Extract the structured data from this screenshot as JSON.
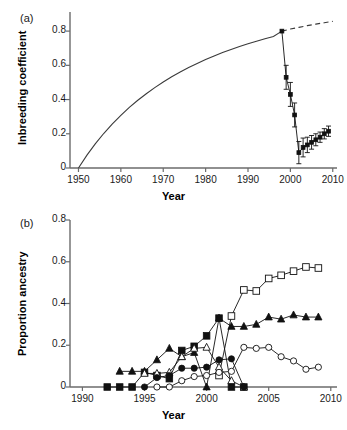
{
  "figure": {
    "panel_a_label": "(a)",
    "panel_b_label": "(b)"
  },
  "chart_data": [
    {
      "id": "panel_a",
      "type": "line",
      "title": "",
      "panel_label": "(a)",
      "xlabel": "Year",
      "ylabel": "Inbreeding coefficient",
      "xlim": [
        1948,
        2011
      ],
      "ylim": [
        0,
        0.9
      ],
      "xticks": [
        1950,
        1960,
        1970,
        1980,
        1990,
        2000,
        2010
      ],
      "xtick_labels": [
        "1950",
        "1960",
        "1970",
        "1980",
        "1990",
        "2000",
        "2010"
      ],
      "yticks": [
        0,
        0.2,
        0.4,
        0.6,
        0.8
      ],
      "ytick_labels": [
        "0",
        "0.2",
        "0.4",
        "0.6",
        "0.8"
      ],
      "grid": false,
      "legend": "none",
      "series": [
        {
          "name": "Predicted inbreeding accumulation (solid curve)",
          "style": "solid-curve",
          "x": [
            1950,
            1952,
            1954,
            1956,
            1958,
            1960,
            1962,
            1964,
            1966,
            1968,
            1970,
            1972,
            1974,
            1976,
            1978,
            1980,
            1982,
            1984,
            1986,
            1988,
            1990,
            1992,
            1994,
            1996,
            1998
          ],
          "values": [
            0.0,
            0.075,
            0.142,
            0.203,
            0.258,
            0.308,
            0.354,
            0.396,
            0.434,
            0.47,
            0.503,
            0.533,
            0.561,
            0.587,
            0.611,
            0.634,
            0.655,
            0.675,
            0.693,
            0.71,
            0.726,
            0.741,
            0.755,
            0.768,
            0.8
          ]
        },
        {
          "name": "Predicted inbreeding extrapolation (dashed curve)",
          "style": "dashed-curve",
          "x": [
            1998,
            2000,
            2002,
            2004,
            2006,
            2008,
            2010
          ],
          "values": [
            0.8,
            0.812,
            0.822,
            0.832,
            0.841,
            0.849,
            0.857
          ]
        },
        {
          "name": "Observed inbreeding coefficient (points with 95% CI)",
          "style": "points-errorbars",
          "x": [
            1998,
            1999,
            2000,
            2001,
            2002,
            2003,
            2004,
            2005,
            2006,
            2007,
            2008,
            2009
          ],
          "values": [
            0.8,
            0.53,
            0.43,
            0.31,
            0.09,
            0.12,
            0.135,
            0.15,
            0.165,
            0.18,
            0.2,
            0.215
          ],
          "err_low": [
            0.0,
            0.07,
            0.07,
            0.07,
            0.065,
            0.055,
            0.045,
            0.04,
            0.035,
            0.03,
            0.03,
            0.03
          ],
          "err_high": [
            0.0,
            0.07,
            0.07,
            0.07,
            0.065,
            0.055,
            0.045,
            0.04,
            0.035,
            0.03,
            0.03,
            0.03
          ]
        }
      ]
    },
    {
      "id": "panel_b",
      "type": "line",
      "title": "",
      "panel_label": "(b)",
      "xlabel": "Year",
      "ylabel": "Proportion ancestry",
      "xlim": [
        1989,
        2010.5
      ],
      "ylim": [
        0,
        0.8
      ],
      "xticks": [
        1990,
        1995,
        2000,
        2005,
        2010
      ],
      "xtick_labels": [
        "1990",
        "1995",
        "2000",
        "2005",
        "2010"
      ],
      "yticks": [
        0,
        0.2,
        0.4,
        0.6,
        0.8
      ],
      "ytick_labels": [
        "0",
        "0.2",
        "0.4",
        "0.6",
        "0.8"
      ],
      "grid": false,
      "legend": "none",
      "series": [
        {
          "name": "Filled squares ancestry",
          "style": "filled-square",
          "x": [
            1992,
            1993,
            1994,
            1995,
            1996,
            1997,
            1998,
            1999,
            2000,
            2001,
            2002,
            2003
          ],
          "values": [
            0.0,
            0.0,
            0.0,
            0.07,
            0.055,
            0.04,
            0.175,
            0.195,
            0.245,
            0.33,
            0.0,
            0.0
          ]
        },
        {
          "name": "Open squares ancestry",
          "style": "open-square",
          "x": [
            2001,
            2002,
            2003,
            2004,
            2005,
            2006,
            2007,
            2008,
            2009
          ],
          "values": [
            0.055,
            0.34,
            0.465,
            0.46,
            0.52,
            0.535,
            0.555,
            0.575,
            0.57
          ]
        },
        {
          "name": "Filled triangles ancestry",
          "style": "filled-triangle",
          "x": [
            1993,
            1994,
            1995,
            1996,
            1997,
            1998,
            1999,
            2000,
            2001,
            2002,
            2003,
            2004,
            2005,
            2006,
            2007,
            2008,
            2009
          ],
          "values": [
            0.075,
            0.075,
            0.075,
            0.13,
            0.185,
            0.145,
            0.165,
            0.0,
            0.33,
            0.29,
            0.29,
            0.3,
            0.335,
            0.325,
            0.345,
            0.335,
            0.335
          ]
        },
        {
          "name": "Open triangles ancestry",
          "style": "open-triangle",
          "x": [
            1995,
            1996,
            1997,
            1998,
            1999,
            2000,
            2001,
            2002,
            2003
          ],
          "values": [
            0.065,
            0.065,
            0.07,
            0.145,
            0.185,
            0.19,
            0.095,
            0.03,
            0.0
          ]
        },
        {
          "name": "Filled circles ancestry",
          "style": "filled-circle",
          "x": [
            1995,
            1996,
            1997,
            1998,
            1999,
            2000,
            2001,
            2002,
            2003
          ],
          "values": [
            0.0,
            0.045,
            0.055,
            0.09,
            0.09,
            0.095,
            0.13,
            0.135,
            0.0
          ]
        },
        {
          "name": "Open circles ancestry",
          "style": "open-circle",
          "x": [
            1996,
            1997,
            1998,
            1999,
            2000,
            2001,
            2002,
            2003,
            2004,
            2005,
            2006,
            2007,
            2008,
            2009
          ],
          "values": [
            0.0,
            0.0,
            0.03,
            0.05,
            0.055,
            0.07,
            0.075,
            0.19,
            0.185,
            0.19,
            0.145,
            0.125,
            0.085,
            0.095
          ]
        }
      ]
    }
  ]
}
